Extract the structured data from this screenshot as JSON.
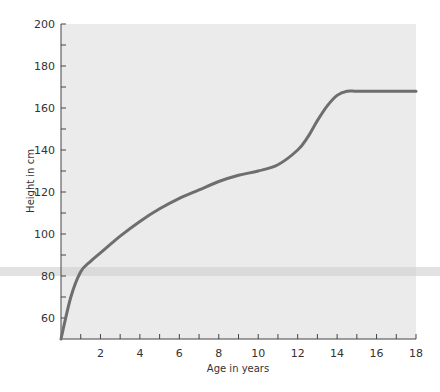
{
  "chart_data": {
    "type": "line",
    "title": "",
    "xlabel": "Age in years",
    "ylabel": "Height in cm",
    "xlim": [
      0,
      18
    ],
    "ylim": [
      50,
      200
    ],
    "x_ticks": [
      2,
      4,
      6,
      8,
      10,
      12,
      14,
      16,
      18
    ],
    "x_minor_ticks": [
      1,
      3,
      5,
      7,
      9,
      11,
      13,
      15,
      17
    ],
    "y_ticks": [
      60,
      80,
      100,
      120,
      140,
      160,
      180,
      200
    ],
    "y_minor_ticks": [
      70,
      90,
      110,
      130,
      150,
      170,
      190
    ],
    "grid": false,
    "series": [
      {
        "name": "Height",
        "color": "#6e6e6e",
        "x": [
          0,
          0.5,
          1,
          1.5,
          2,
          3,
          4,
          5,
          6,
          7,
          8,
          9,
          10,
          11,
          12,
          12.5,
          13,
          13.5,
          14,
          14.5,
          15,
          16,
          17,
          18
        ],
        "y": [
          50,
          70,
          82,
          87,
          91,
          99,
          106,
          112,
          117,
          121,
          125,
          128,
          130,
          133,
          140,
          146,
          154,
          161,
          166,
          168,
          168,
          168,
          168,
          168
        ]
      }
    ],
    "annotations": [
      {
        "type": "horizontal-band",
        "y_approx": 82,
        "description": "faint gray horizontal band crossing chart near 82 cm"
      }
    ]
  }
}
